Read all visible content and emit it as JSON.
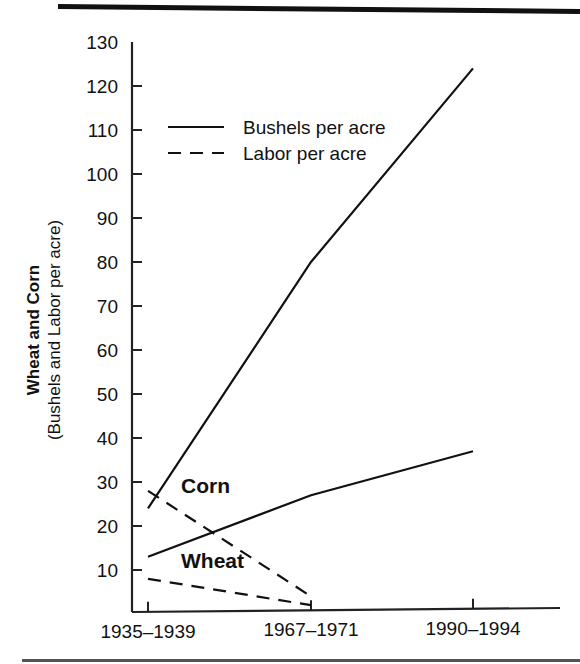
{
  "chart_data": {
    "type": "line",
    "title": "",
    "xlabel": "",
    "ylabel": "Wheat and Corn",
    "ylabel_sub": "(Bushels and Labor per acre)",
    "categories": [
      "1935–1939",
      "1967–1971",
      "1990–1994"
    ],
    "ylim": [
      0,
      130
    ],
    "yticks": [
      10,
      20,
      30,
      40,
      50,
      60,
      70,
      80,
      90,
      100,
      110,
      120,
      130
    ],
    "ytick_labels": [
      "10",
      "20",
      "30",
      "40",
      "50",
      "60",
      "70",
      "80",
      "90",
      "100",
      "110",
      "120",
      "130"
    ],
    "grid": false,
    "legend_position": "upper-left-inside",
    "legend": [
      {
        "label": "Bushels per acre",
        "style": "solid"
      },
      {
        "label": "Labor per acre",
        "style": "dashed"
      }
    ],
    "annotations": [
      {
        "text": "Corn",
        "x_index": 0,
        "y_value": 29,
        "bold": true
      },
      {
        "text": "Wheat",
        "x_index": 0,
        "y_value": 12,
        "bold": true
      }
    ],
    "series": [
      {
        "name": "Corn — Bushels per acre",
        "group": "Corn",
        "measure": "Bushels per acre",
        "style": "solid",
        "values": [
          24,
          80,
          124
        ]
      },
      {
        "name": "Corn — Labor per acre",
        "group": "Corn",
        "measure": "Labor per acre",
        "style": "dashed",
        "values": [
          28,
          4,
          null
        ]
      },
      {
        "name": "Wheat — Bushels per acre",
        "group": "Wheat",
        "measure": "Bushels per acre",
        "style": "solid",
        "values": [
          13,
          27,
          37
        ]
      },
      {
        "name": "Wheat — Labor per acre",
        "group": "Wheat",
        "measure": "Labor per acre",
        "style": "dashed",
        "values": [
          8,
          2,
          null
        ]
      }
    ]
  },
  "figure": {
    "has_top_rule": true,
    "has_bottom_rule": true,
    "background_color": "#ffffff",
    "ink_color": "#111111"
  }
}
